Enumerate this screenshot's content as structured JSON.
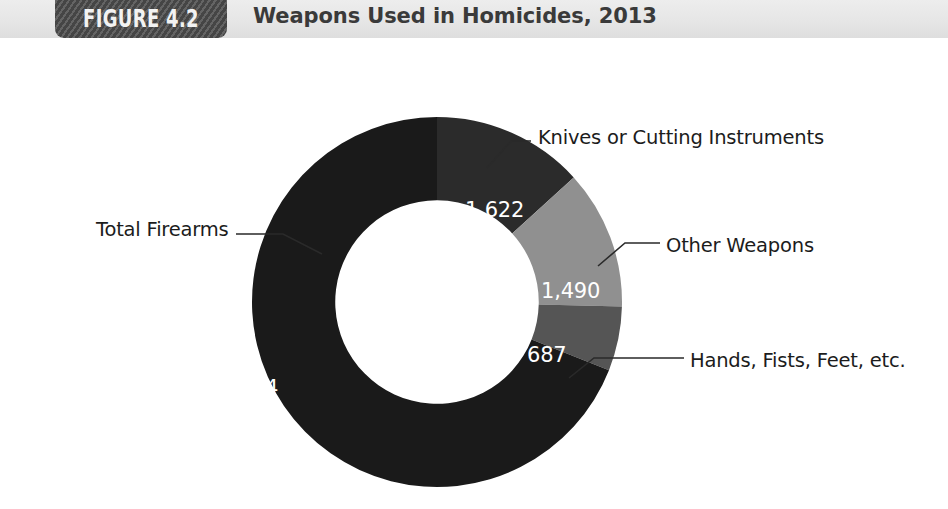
{
  "figure": {
    "badge_label": "FIGURE 4.2",
    "title": "Weapons Used in Homicides, 2013"
  },
  "colors": {
    "header_band": "#e8e8e8",
    "badge": "#4d4d4d",
    "title_text": "#3a3a3a",
    "total_firearms": "#1a1a1a",
    "knives": "#2b2b2b",
    "other_weapons": "#909090",
    "hands_fists_feet": "#555555",
    "label_text": "#1c1c1c",
    "value_text": "#ffffff",
    "leader_line": "#2a2a2a",
    "background": "#ffffff"
  },
  "chart_data": {
    "type": "pie",
    "variant": "donut",
    "title": "Weapons Used in Homicides, 2013",
    "xlabel": "",
    "ylabel": "",
    "total": 12253,
    "units": "homicides",
    "start_angle_deg": 0,
    "direction": "clockwise",
    "inner_radius_ratio": 0.55,
    "legend": "none",
    "grid": false,
    "categories": [
      "Knives or Cutting Instruments",
      "Other Weapons",
      "Hands, Fists, Feet, etc.",
      "Total Firearms"
    ],
    "values": [
      1622,
      1490,
      687,
      8454
    ],
    "slices": [
      {
        "label": "Knives or Cutting Instruments",
        "value": 1622,
        "value_label": "1,622",
        "color": "#2b2b2b",
        "percent": 13.2
      },
      {
        "label": "Other Weapons",
        "value": 1490,
        "value_label": "1,490",
        "color": "#909090",
        "percent": 12.2
      },
      {
        "label": "Hands, Fists, Feet, etc.",
        "value": 687,
        "value_label": "687",
        "color": "#555555",
        "percent": 5.6
      },
      {
        "label": "Total Firearms",
        "value": 8454,
        "value_label": "8,454",
        "color": "#1a1a1a",
        "percent": 69.0
      }
    ]
  }
}
